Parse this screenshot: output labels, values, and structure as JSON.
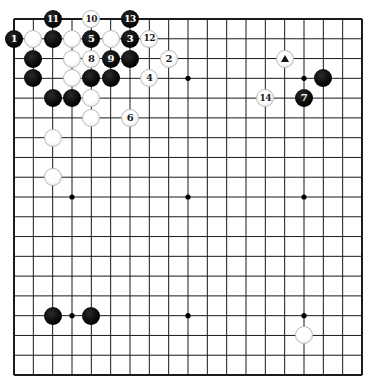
{
  "board": {
    "size": 19,
    "origin_px": {
      "x": 14,
      "y": 19
    },
    "end_px": {
      "x": 362,
      "y": 375
    },
    "line_color": "#1a1a1a",
    "background": "#ffffff",
    "star_points": [
      [
        4,
        4
      ],
      [
        10,
        4
      ],
      [
        16,
        4
      ],
      [
        4,
        10
      ],
      [
        10,
        10
      ],
      [
        16,
        10
      ],
      [
        4,
        16
      ],
      [
        10,
        16
      ],
      [
        16,
        16
      ]
    ]
  },
  "stones": [
    {
      "col": 3,
      "row": 1,
      "color": "black",
      "label": "11"
    },
    {
      "col": 5,
      "row": 1,
      "color": "white",
      "label": "10"
    },
    {
      "col": 7,
      "row": 1,
      "color": "black",
      "label": "13"
    },
    {
      "col": 1,
      "row": 2,
      "color": "black",
      "label": "1"
    },
    {
      "col": 2,
      "row": 2,
      "color": "white",
      "label": ""
    },
    {
      "col": 3,
      "row": 2,
      "color": "black",
      "label": ""
    },
    {
      "col": 4,
      "row": 2,
      "color": "white",
      "label": ""
    },
    {
      "col": 5,
      "row": 2,
      "color": "black",
      "label": "5"
    },
    {
      "col": 6,
      "row": 2,
      "color": "white",
      "label": ""
    },
    {
      "col": 7,
      "row": 2,
      "color": "black",
      "label": "3"
    },
    {
      "col": 8,
      "row": 2,
      "color": "white",
      "label": "12"
    },
    {
      "col": 2,
      "row": 3,
      "color": "black",
      "label": ""
    },
    {
      "col": 4,
      "row": 3,
      "color": "white",
      "label": ""
    },
    {
      "col": 5,
      "row": 3,
      "color": "white",
      "label": "8"
    },
    {
      "col": 6,
      "row": 3,
      "color": "black",
      "label": "9"
    },
    {
      "col": 7,
      "row": 3,
      "color": "black",
      "label": ""
    },
    {
      "col": 9,
      "row": 3,
      "color": "white",
      "label": "2"
    },
    {
      "col": 2,
      "row": 4,
      "color": "black",
      "label": ""
    },
    {
      "col": 4,
      "row": 4,
      "color": "white",
      "label": ""
    },
    {
      "col": 5,
      "row": 4,
      "color": "black",
      "label": ""
    },
    {
      "col": 6,
      "row": 4,
      "color": "black",
      "label": ""
    },
    {
      "col": 8,
      "row": 4,
      "color": "white",
      "label": "4"
    },
    {
      "col": 3,
      "row": 5,
      "color": "black",
      "label": ""
    },
    {
      "col": 4,
      "row": 5,
      "color": "black",
      "label": ""
    },
    {
      "col": 5,
      "row": 5,
      "color": "white",
      "label": ""
    },
    {
      "col": 5,
      "row": 6,
      "color": "white",
      "label": ""
    },
    {
      "col": 7,
      "row": 6,
      "color": "white",
      "label": "6"
    },
    {
      "col": 3,
      "row": 7,
      "color": "white",
      "label": ""
    },
    {
      "col": 3,
      "row": 9,
      "color": "white",
      "label": ""
    },
    {
      "col": 15,
      "row": 3,
      "color": "white",
      "label": "",
      "marker": "triangle"
    },
    {
      "col": 17,
      "row": 4,
      "color": "black",
      "label": ""
    },
    {
      "col": 16,
      "row": 5,
      "color": "black",
      "label": "7"
    },
    {
      "col": 14,
      "row": 5,
      "color": "white",
      "label": "14"
    },
    {
      "col": 3,
      "row": 16,
      "color": "black",
      "label": ""
    },
    {
      "col": 5,
      "row": 16,
      "color": "black",
      "label": ""
    },
    {
      "col": 16,
      "row": 17,
      "color": "white",
      "label": ""
    }
  ]
}
